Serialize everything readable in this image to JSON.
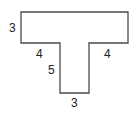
{
  "diagram": {
    "shape": "T-shape",
    "stroke_color": "#4a4a4a",
    "labels": {
      "top_bar_height": "3",
      "left_overhang": "4",
      "right_overhang": "4",
      "stem_height": "5",
      "stem_width": "3"
    }
  }
}
